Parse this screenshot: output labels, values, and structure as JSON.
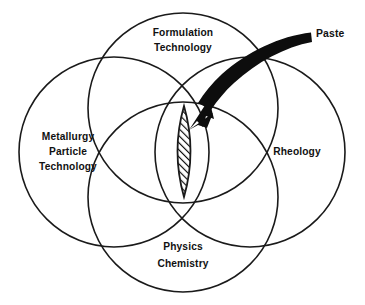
{
  "diagram": {
    "type": "venn-diagram",
    "background_color": "#ffffff",
    "stroke_color": "#1a1a1a",
    "fill_color": "#0d0d0d",
    "circles": [
      {
        "id": "formulation",
        "position": "top",
        "label_lines": [
          "Formulation",
          "Technology"
        ],
        "line1": "Formulation",
        "line2": "Technology",
        "cx": 183,
        "cy": 108,
        "r": 95
      },
      {
        "id": "metallurgy",
        "position": "left",
        "label_lines": [
          "Metallurgy",
          "Particle",
          "Technology"
        ],
        "line1": "Metallurgy",
        "line2": "Particle",
        "line3": "Technology",
        "cx": 114,
        "cy": 152,
        "r": 95
      },
      {
        "id": "rheology",
        "position": "right",
        "label_lines": [
          "Rheology"
        ],
        "line1": "Rheology",
        "cx": 250,
        "cy": 152,
        "r": 95
      },
      {
        "id": "physics-chemistry",
        "position": "bottom",
        "label_lines": [
          "Physics",
          "Chemistry"
        ],
        "line1": "Physics",
        "line2": "Chemistry",
        "cx": 183,
        "cy": 197,
        "r": 95
      }
    ],
    "intersection": {
      "id": "paste-lens",
      "shape": "lens",
      "fill_pattern": "diagonal-hatch",
      "top_vertex_x": 184,
      "top_vertex_y": 106,
      "bottom_vertex_x": 184,
      "bottom_vertex_y": 197,
      "width": 24
    },
    "callout": {
      "id": "paste-callout",
      "label": "Paste",
      "label_x": 316,
      "label_y": 34,
      "arrow_start_x": 312,
      "arrow_start_y": 33,
      "arrow_tip_x": 190,
      "arrow_tip_y": 130
    }
  }
}
